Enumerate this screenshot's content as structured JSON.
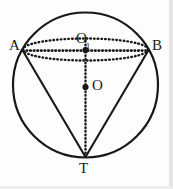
{
  "figure": {
    "background_color": "#fdfdfd",
    "stroke_color": "#181818",
    "labels": {
      "a": "A",
      "b": "B",
      "o1_base": "O",
      "o1_sub": "1",
      "o": "O",
      "t": "T"
    },
    "points": [
      {
        "name": "A",
        "label": "A",
        "x": 23,
        "y": 51,
        "marker": "vertex-on-circle"
      },
      {
        "name": "B",
        "label": "B",
        "x": 148,
        "y": 51,
        "marker": "vertex-on-circle"
      },
      {
        "name": "O1",
        "label": "O1",
        "x": 85.5,
        "y": 50,
        "marker": "filled-dot"
      },
      {
        "name": "O",
        "label": "O",
        "x": 85.5,
        "y": 87,
        "marker": "filled-dot"
      },
      {
        "name": "T",
        "label": "T",
        "x": 85.5,
        "y": 157,
        "marker": "apex-on-circle"
      }
    ],
    "shapes": {
      "sphere_circle": {
        "cx": 85.5,
        "cy": 85,
        "r": 72.5,
        "style": "solid",
        "stroke_width": 2.1
      },
      "base_ellipse": {
        "cx": 85.5,
        "cy": 49.5,
        "rx": 62.5,
        "ry": 11,
        "style": "dotted",
        "stroke_width": 2.2
      },
      "chord_ab": {
        "x1": 23,
        "y1": 51,
        "x2": 148,
        "y2": 51,
        "style": "dotted"
      },
      "axis_o1t": {
        "x1": 85.5,
        "y1": 50,
        "x2": 85.5,
        "y2": 157,
        "style": "dotted"
      },
      "edge_at": {
        "x1": 23,
        "y1": 51,
        "x2": 85.5,
        "y2": 157,
        "style": "solid"
      },
      "edge_bt": {
        "x1": 148,
        "y1": 51,
        "x2": 85.5,
        "y2": 157,
        "style": "solid"
      }
    }
  }
}
